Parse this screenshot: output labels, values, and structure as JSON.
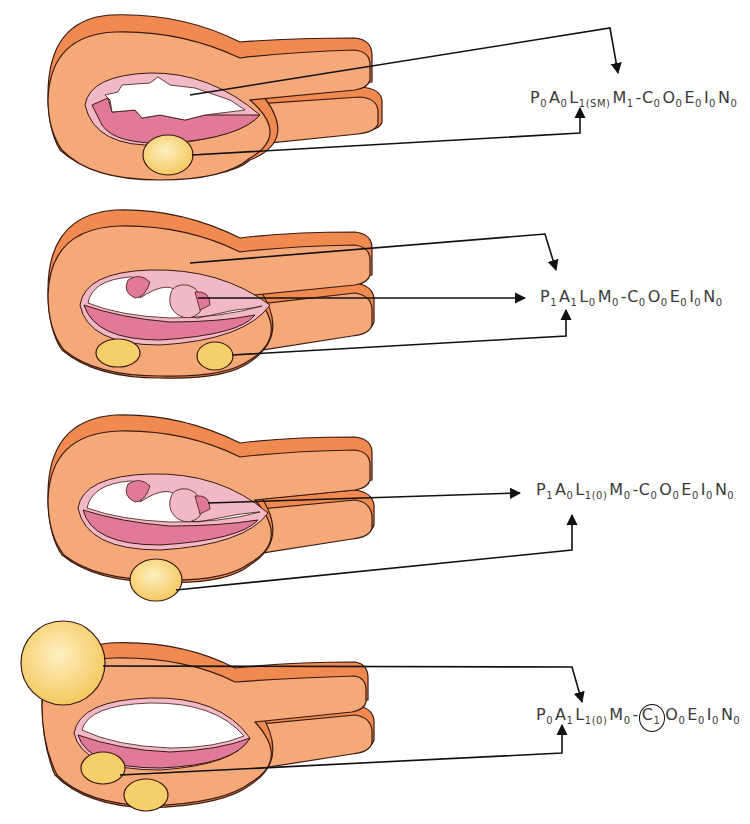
{
  "colors": {
    "outer_muscle": "#f08a50",
    "myometrium": "#f5a878",
    "endometrium_light": "#f2b8c6",
    "endometrium_dark": "#e07a98",
    "cavity": "#ffffff",
    "fibroid": "#f7cf6a",
    "fibroid_light": "#fbe6a2",
    "outline": "#3a1a10",
    "arrow": "#111111",
    "text": "#3a3a3a"
  },
  "panels": [
    {
      "id": "panel-1",
      "classification": [
        {
          "letter": "P",
          "sub": "0"
        },
        {
          "letter": "A",
          "sub": "0"
        },
        {
          "letter": "L",
          "sub": "1(SM)"
        },
        {
          "letter": "M",
          "sub": "1"
        },
        {
          "letter": "-",
          "sub": ""
        },
        {
          "letter": "C",
          "sub": "0"
        },
        {
          "letter": "O",
          "sub": "0"
        },
        {
          "letter": "E",
          "sub": "0"
        },
        {
          "letter": "I",
          "sub": "0"
        },
        {
          "letter": "N",
          "sub": "0"
        }
      ]
    },
    {
      "id": "panel-2",
      "classification": [
        {
          "letter": "P",
          "sub": "1"
        },
        {
          "letter": "A",
          "sub": "1"
        },
        {
          "letter": "L",
          "sub": "0"
        },
        {
          "letter": "M",
          "sub": "0"
        },
        {
          "letter": "-",
          "sub": ""
        },
        {
          "letter": "C",
          "sub": "0"
        },
        {
          "letter": "O",
          "sub": "0"
        },
        {
          "letter": "E",
          "sub": "0"
        },
        {
          "letter": "I",
          "sub": "0"
        },
        {
          "letter": "N",
          "sub": "0"
        }
      ]
    },
    {
      "id": "panel-3",
      "classification": [
        {
          "letter": "P",
          "sub": "1"
        },
        {
          "letter": "A",
          "sub": "0"
        },
        {
          "letter": "L",
          "sub": "1(0)"
        },
        {
          "letter": "M",
          "sub": "0"
        },
        {
          "letter": "-",
          "sub": ""
        },
        {
          "letter": "C",
          "sub": "0"
        },
        {
          "letter": "O",
          "sub": "0"
        },
        {
          "letter": "E",
          "sub": "0"
        },
        {
          "letter": "I",
          "sub": "0"
        },
        {
          "letter": "N",
          "sub": "0"
        }
      ]
    },
    {
      "id": "panel-4",
      "classification": [
        {
          "letter": "P",
          "sub": "0"
        },
        {
          "letter": "A",
          "sub": "1"
        },
        {
          "letter": "L",
          "sub": "1(0)"
        },
        {
          "letter": "M",
          "sub": "0"
        },
        {
          "letter": "-",
          "sub": ""
        },
        {
          "letter": "C",
          "sub": "1",
          "circled": true
        },
        {
          "letter": "O",
          "sub": "0"
        },
        {
          "letter": "E",
          "sub": "0"
        },
        {
          "letter": "I",
          "sub": "0"
        },
        {
          "letter": "N",
          "sub": "0"
        }
      ]
    }
  ]
}
